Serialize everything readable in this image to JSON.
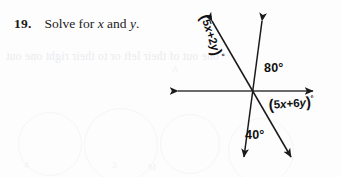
{
  "page": {
    "width": 341,
    "height": 177,
    "background_color": "#fdfdfd",
    "ink_color": "#111111"
  },
  "problem": {
    "number": "19.",
    "text_before_first_var": "Solve for",
    "variable_1": "x",
    "conjunction": "and",
    "variable_2": "y",
    "terminator": ".",
    "full_text": "19. Solve for x and y."
  },
  "diagram": {
    "name": "intersecting-lines-angle-diagram",
    "intersection_point": {
      "x": 252,
      "y": 91
    },
    "lines": [
      {
        "id": "horizontal-line",
        "label": "horizontal line",
        "from": {
          "x": 176,
          "y": 91
        },
        "to": {
          "x": 315,
          "y": 91
        },
        "arrow_start": true,
        "arrow_end": true
      },
      {
        "id": "steep-line",
        "label": "steep line from upper right to lower left",
        "from": {
          "x": 262,
          "y": 18
        },
        "to": {
          "x": 243,
          "y": 161
        },
        "arrow_start": true,
        "arrow_end": true
      },
      {
        "id": "oblique-line",
        "label": "oblique line from upper left to lower right",
        "from": {
          "x": 210,
          "y": 17
        },
        "to": {
          "x": 293,
          "y": 161
        },
        "arrow_start": true,
        "arrow_end": true
      }
    ],
    "angle_labels": [
      {
        "id": "angle-80",
        "text": "80°",
        "value": 80,
        "unit": "degrees",
        "position": {
          "x": 264,
          "y": 61
        },
        "region": "between upward steep ray and right horizontal ray"
      },
      {
        "id": "angle-40",
        "text": "40°",
        "value": 40,
        "unit": "degrees",
        "position": {
          "x": 245,
          "y": 128
        },
        "region": "between downward steep ray and downward oblique ray"
      },
      {
        "id": "angle-5x-plus-2y",
        "text": "(5x + 2y)°",
        "expression": "5x + 2y",
        "unit": "degrees",
        "position": {
          "x": 213,
          "y": 12
        },
        "rotation_deg": 72,
        "region": "between upward oblique ray and upward steep ray"
      },
      {
        "id": "angle-5x-plus-6y",
        "text": "(5x + 6y)°",
        "expression": "5x + 6y",
        "unit": "degrees",
        "position": {
          "x": 268,
          "y": 96
        },
        "rotation_deg": -4,
        "region": "between right horizontal ray and downward oblique ray"
      }
    ],
    "expression_parts": {
      "upper": {
        "open_paren": "(",
        "coefficient_x": "5",
        "var_x": "x",
        "operator": "+",
        "coefficient_y": "2",
        "var_y": "y",
        "close_paren": ")",
        "degree": "°"
      },
      "lower": {
        "open_paren": "(",
        "coefficient_x": "5",
        "var_x": "x",
        "operator": "+",
        "coefficient_y": "6",
        "var_y": "y",
        "close_paren": ")",
        "degree": "°"
      }
    }
  },
  "scan_artifacts": {
    "show_through_text": "one out of their left or to their right one out",
    "show_through_note": "faint mirrored bleed-through from the reverse page",
    "faint_marks": [
      "4",
      "3",
      "M",
      "A"
    ]
  }
}
